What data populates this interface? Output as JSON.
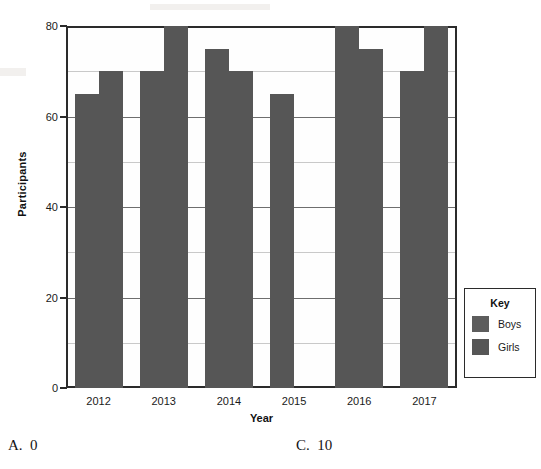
{
  "chart_data": {
    "type": "bar",
    "title": "",
    "xlabel": "Year",
    "ylabel": "Participants",
    "categories": [
      "2012",
      "2013",
      "2014",
      "2015",
      "2016",
      "2017"
    ],
    "series": [
      {
        "name": "Boys",
        "color": "#565656",
        "values": [
          65,
          70,
          75,
          65,
          80,
          70
        ]
      },
      {
        "name": "Girls",
        "color": "#565656",
        "values": [
          70,
          80,
          70,
          0,
          75,
          80
        ]
      }
    ],
    "ylim": [
      0,
      80
    ],
    "yticks": [
      0,
      20,
      40,
      60,
      80
    ],
    "ytick_labels": [
      "0",
      "20",
      "40",
      "60",
      "80"
    ],
    "minor_gridlines": [
      10,
      30,
      50,
      70
    ],
    "grid": true,
    "legend_position": "right-outside"
  },
  "legend": {
    "title": "Key",
    "entries": [
      {
        "label": "Boys",
        "color": "#5d5d5d"
      },
      {
        "label": "Girls",
        "color": "#565656"
      }
    ]
  },
  "answers": {
    "option_a": "A.  0",
    "option_c": "C.  10"
  }
}
